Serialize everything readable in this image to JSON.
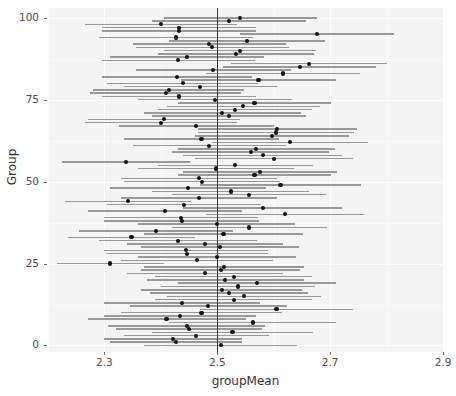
{
  "chart_data": {
    "type": "scatter",
    "title": "",
    "subtitle": "",
    "xlabel": "groupMean",
    "ylabel": "Group",
    "xlim": [
      2.2,
      2.9
    ],
    "ylim": [
      -2,
      103
    ],
    "grid": true,
    "legend": null,
    "plot_description": "Caterpillar / forest plot of 101 group means with confidence intervals and a vertical reference line at 2.5",
    "reference_line": {
      "orientation": "vertical",
      "value": 2.5,
      "color": "#3a3a3a"
    },
    "interval_color": "#999999",
    "point_color": "#141414",
    "panel_background": "#f4f4f4",
    "gridline_color": "#ffffff",
    "xticks": [
      2.3,
      2.5,
      2.7,
      2.9
    ],
    "xtick_labels": [
      "2.3",
      "2.5",
      "2.7",
      "2.9"
    ],
    "yticks": [
      0,
      25,
      50,
      75,
      100
    ],
    "ytick_labels": [
      "0",
      "25",
      "50",
      "75",
      "100"
    ],
    "series": [
      {
        "name": "groupMean",
        "group": [
          0,
          1,
          2,
          3,
          4,
          5,
          6,
          7,
          8,
          9,
          10,
          11,
          12,
          13,
          14,
          15,
          16,
          17,
          18,
          19,
          20,
          21,
          22,
          23,
          24,
          25,
          26,
          27,
          28,
          29,
          30,
          31,
          32,
          33,
          34,
          35,
          36,
          37,
          38,
          39,
          40,
          41,
          42,
          43,
          44,
          45,
          46,
          47,
          48,
          49,
          50,
          51,
          52,
          53,
          54,
          55,
          56,
          57,
          58,
          59,
          60,
          61,
          62,
          63,
          64,
          65,
          66,
          67,
          68,
          69,
          70,
          71,
          72,
          73,
          74,
          75,
          76,
          77,
          78,
          79,
          80,
          81,
          82,
          83,
          84,
          85,
          86,
          87,
          88,
          89,
          90,
          91,
          92,
          93,
          94,
          95,
          96,
          97,
          98,
          99,
          100
        ],
        "mean": [
          2.506,
          2.427,
          2.421,
          2.463,
          2.527,
          2.45,
          2.446,
          2.563,
          2.41,
          2.434,
          2.472,
          2.605,
          2.484,
          2.438,
          2.529,
          2.547,
          2.52,
          2.508,
          2.537,
          2.57,
          2.514,
          2.529,
          2.478,
          2.506,
          2.512,
          2.31,
          2.464,
          2.5,
          2.447,
          2.445,
          2.505,
          2.478,
          2.43,
          2.348,
          2.511,
          2.391,
          2.557,
          2.499,
          2.437,
          2.436,
          2.62,
          2.407,
          2.581,
          2.441,
          2.342,
          2.468,
          2.556,
          2.524,
          2.448,
          2.612,
          2.473,
          2.468,
          2.566,
          2.576,
          2.498,
          2.532,
          2.338,
          2.6,
          2.581,
          2.559,
          2.569,
          2.486,
          2.629,
          2.472,
          2.597,
          2.604,
          2.606,
          2.463,
          2.4,
          2.405,
          2.521,
          2.509,
          2.531,
          2.546,
          2.566,
          2.496,
          2.432,
          2.409,
          2.414,
          2.47,
          2.439,
          2.573,
          2.428,
          2.616,
          2.493,
          2.646,
          2.663,
          2.431,
          2.446,
          2.533,
          2.54,
          2.491,
          2.486,
          2.553,
          2.427,
          2.677,
          2.432,
          2.432,
          2.4,
          2.521,
          2.541
        ],
        "ci_low": [
          2.37,
          2.31,
          2.299,
          2.334,
          2.385,
          2.32,
          2.307,
          2.415,
          2.27,
          2.3,
          2.33,
          2.47,
          2.345,
          2.3,
          2.39,
          2.41,
          2.38,
          2.365,
          2.4,
          2.43,
          2.375,
          2.39,
          2.34,
          2.365,
          2.37,
          2.215,
          2.33,
          2.36,
          2.305,
          2.3,
          2.365,
          2.34,
          2.29,
          2.235,
          2.37,
          2.255,
          2.42,
          2.36,
          2.3,
          2.3,
          2.48,
          2.27,
          2.44,
          2.305,
          2.23,
          2.33,
          2.42,
          2.385,
          2.31,
          2.47,
          2.335,
          2.33,
          2.43,
          2.44,
          2.36,
          2.395,
          2.225,
          2.46,
          2.44,
          2.42,
          2.43,
          2.35,
          2.49,
          2.335,
          2.46,
          2.465,
          2.465,
          2.325,
          2.265,
          2.27,
          2.385,
          2.37,
          2.395,
          2.41,
          2.43,
          2.36,
          2.295,
          2.275,
          2.28,
          2.335,
          2.305,
          2.435,
          2.295,
          2.48,
          2.355,
          2.51,
          2.525,
          2.295,
          2.31,
          2.395,
          2.405,
          2.355,
          2.35,
          2.415,
          2.29,
          2.54,
          2.295,
          2.295,
          2.265,
          2.385,
          2.405
        ],
        "ci_high": [
          2.642,
          2.544,
          2.543,
          2.592,
          2.669,
          2.58,
          2.585,
          2.711,
          2.55,
          2.568,
          2.614,
          2.74,
          2.623,
          2.576,
          2.668,
          2.684,
          2.66,
          2.651,
          2.674,
          2.71,
          2.653,
          2.668,
          2.616,
          2.647,
          2.654,
          2.405,
          2.598,
          2.64,
          2.589,
          2.59,
          2.645,
          2.616,
          2.57,
          2.461,
          2.652,
          2.527,
          2.694,
          2.638,
          2.574,
          2.572,
          2.76,
          2.544,
          2.722,
          2.577,
          2.454,
          2.606,
          2.692,
          2.663,
          2.586,
          2.754,
          2.611,
          2.606,
          2.702,
          2.712,
          2.636,
          2.669,
          2.451,
          2.74,
          2.722,
          2.698,
          2.708,
          2.622,
          2.768,
          2.609,
          2.734,
          2.743,
          2.747,
          2.601,
          2.535,
          2.54,
          2.657,
          2.648,
          2.667,
          2.682,
          2.702,
          2.632,
          2.569,
          2.543,
          2.548,
          2.605,
          2.573,
          2.711,
          2.561,
          2.752,
          2.631,
          2.782,
          2.801,
          2.567,
          2.582,
          2.671,
          2.675,
          2.627,
          2.622,
          2.691,
          2.564,
          2.814,
          2.569,
          2.569,
          2.535,
          2.657,
          2.677
        ]
      }
    ]
  },
  "axes": {
    "x": {
      "title": "groupMean",
      "ticks": [
        {
          "value": 2.3,
          "label": "2.3"
        },
        {
          "value": 2.5,
          "label": "2.5"
        },
        {
          "value": 2.7,
          "label": "2.7"
        },
        {
          "value": 2.9,
          "label": "2.9"
        }
      ]
    },
    "y": {
      "title": "Group",
      "ticks": [
        {
          "value": 0,
          "label": "0"
        },
        {
          "value": 25,
          "label": "25"
        },
        {
          "value": 50,
          "label": "50"
        },
        {
          "value": 75,
          "label": "75"
        },
        {
          "value": 100,
          "label": "100"
        }
      ]
    }
  }
}
